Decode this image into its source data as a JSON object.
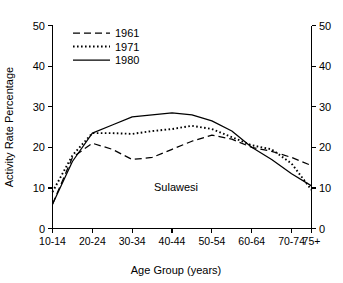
{
  "chart_data": {
    "type": "line",
    "title": "",
    "annotation": "Sulawesi",
    "xlabel": "Age Group (years)",
    "ylabel": "Activity Rate Percentage",
    "grid": false,
    "legend_position": "top-left",
    "ylim": [
      0,
      50
    ],
    "yticks": [
      0,
      10,
      20,
      30,
      40,
      50
    ],
    "ytick_labels": [
      "0",
      "10",
      "20",
      "30",
      "40",
      "50"
    ],
    "right_axis": true,
    "right_yticks": [
      0,
      10,
      20,
      30,
      40,
      50
    ],
    "right_ytick_labels": [
      "0",
      "10",
      "20",
      "30",
      "40",
      "50"
    ],
    "categories": [
      "10-14",
      "15-19",
      "20-24",
      "25-29",
      "30-34",
      "35-39",
      "40-44",
      "45-49",
      "50-54",
      "55-59",
      "60-64",
      "65-69",
      "70-74",
      "75+"
    ],
    "xtick_labels": [
      "10-14",
      "20-24",
      "30-34",
      "40-44",
      "50-54",
      "60-64",
      "70-74",
      "75+"
    ],
    "xtick_categories": [
      "10-14",
      "20-24",
      "30-34",
      "40-44",
      "50-54",
      "60-64",
      "70-74",
      "75+"
    ],
    "series": [
      {
        "name": "1961",
        "style": "dashed",
        "values": [
          6.0,
          17.5,
          21.0,
          19.5,
          17.0,
          17.5,
          19.5,
          21.5,
          23.0,
          22.0,
          20.0,
          19.0,
          17.5,
          15.5
        ]
      },
      {
        "name": "1971",
        "style": "dotted",
        "values": [
          9.0,
          18.0,
          23.5,
          23.5,
          23.3,
          24.0,
          24.5,
          25.3,
          24.5,
          22.5,
          20.5,
          19.5,
          16.0,
          9.5
        ]
      },
      {
        "name": "1980",
        "style": "solid",
        "values": [
          6.0,
          16.5,
          23.5,
          25.5,
          27.5,
          28.0,
          28.5,
          28.0,
          26.5,
          24.0,
          20.0,
          17.0,
          13.5,
          10.5
        ]
      }
    ]
  },
  "legend": {
    "items": [
      {
        "label": "1961",
        "style": "dashed"
      },
      {
        "label": "1971",
        "style": "dotted"
      },
      {
        "label": "1980",
        "style": "solid"
      }
    ]
  }
}
